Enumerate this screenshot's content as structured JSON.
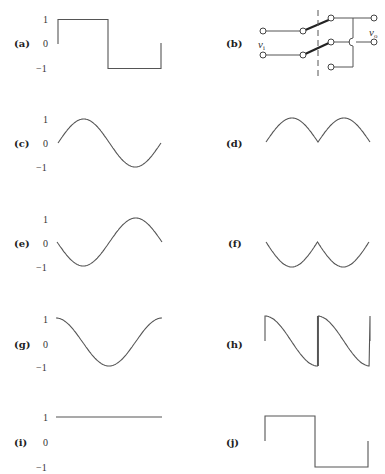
{
  "figure": {
    "panels": [
      {
        "id": "a",
        "label": "(a)",
        "kind": "square-wave",
        "ticks": [
          "1",
          "0",
          "−1"
        ]
      },
      {
        "id": "b",
        "label": "(b)",
        "kind": "circuit-dpdt-switch",
        "input_label": "v",
        "input_sub": "i",
        "output_label": "v",
        "output_sub": "o"
      },
      {
        "id": "c",
        "label": "(c)",
        "kind": "sine",
        "ticks": [
          "1",
          "0",
          "−1"
        ]
      },
      {
        "id": "d",
        "label": "(d)",
        "kind": "full-wave-rectified-sine"
      },
      {
        "id": "e",
        "label": "(e)",
        "kind": "negative-sine",
        "ticks": [
          "1",
          "0",
          "−1"
        ]
      },
      {
        "id": "f",
        "label": "(f)",
        "kind": "negative-full-wave-rectified-sine"
      },
      {
        "id": "g",
        "label": "(g)",
        "kind": "cosine",
        "ticks": [
          "1",
          "0",
          "−1"
        ]
      },
      {
        "id": "h",
        "label": "(h)",
        "kind": "switched-cosine-segments"
      },
      {
        "id": "i",
        "label": "(i)",
        "kind": "constant-one",
        "ticks": [
          "1",
          "0",
          "−1"
        ]
      },
      {
        "id": "j",
        "label": "(j)",
        "kind": "square-wave"
      }
    ]
  }
}
